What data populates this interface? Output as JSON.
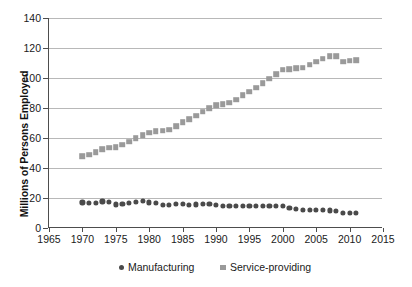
{
  "chart_data": {
    "type": "scatter",
    "title": "",
    "xlabel": "",
    "ylabel": "Millions of Persons Employed",
    "xlim": [
      1965,
      2015
    ],
    "ylim": [
      0,
      140
    ],
    "xticks": [
      1965,
      1970,
      1975,
      1980,
      1985,
      1990,
      1995,
      2000,
      2005,
      2010,
      2015
    ],
    "yticks": [
      0,
      20,
      40,
      60,
      80,
      100,
      120,
      140
    ],
    "grid": "horizontal",
    "legend_position": "bottom-center",
    "x": [
      1970,
      1971,
      1972,
      1973,
      1974,
      1975,
      1976,
      1977,
      1978,
      1979,
      1980,
      1981,
      1982,
      1983,
      1984,
      1985,
      1986,
      1987,
      1988,
      1989,
      1990,
      1991,
      1992,
      1993,
      1994,
      1995,
      1996,
      1997,
      1998,
      1999,
      2000,
      2001,
      2002,
      2003,
      2004,
      2005,
      2006,
      2007,
      2008,
      2009,
      2010,
      2011
    ],
    "series": [
      {
        "name": "Manufacturing",
        "marker": "circle",
        "color": "#4a4a4a",
        "values": [
          17.1,
          16.8,
          17.0,
          17.7,
          17.6,
          15.7,
          16.2,
          16.8,
          17.5,
          17.9,
          17.1,
          17.0,
          15.5,
          15.3,
          16.0,
          15.8,
          15.6,
          15.7,
          15.9,
          15.8,
          15.4,
          14.8,
          14.5,
          14.5,
          14.8,
          15.0,
          14.9,
          15.0,
          15.0,
          14.7,
          14.5,
          13.5,
          12.6,
          12.1,
          12.0,
          11.9,
          11.9,
          11.7,
          11.3,
          10.3,
          10.0,
          10.0
        ]
      },
      {
        "name": "Service-providing",
        "marker": "square",
        "color": "#9a9a9a",
        "values": [
          48.0,
          49.0,
          50.5,
          52.5,
          53.5,
          54.0,
          55.5,
          57.5,
          60.0,
          62.0,
          63.5,
          64.5,
          65.0,
          65.5,
          68.0,
          70.5,
          72.5,
          75.0,
          77.5,
          80.0,
          82.0,
          82.5,
          83.5,
          85.5,
          88.5,
          91.0,
          93.5,
          96.5,
          99.5,
          102.5,
          105.5,
          106.0,
          106.5,
          107.0,
          109.0,
          111.0,
          113.0,
          114.5,
          114.5,
          111.0,
          111.5,
          112.0
        ]
      }
    ]
  },
  "legend": {
    "entries": [
      {
        "label": "Manufacturing"
      },
      {
        "label": "Service-providing"
      }
    ]
  },
  "axes": {
    "y_title": "Millions of Persons Employed",
    "y_labels": [
      "140",
      "120",
      "100",
      "80",
      "60",
      "40",
      "20",
      "0"
    ],
    "x_labels": [
      "1965",
      "1970",
      "1975",
      "1980",
      "1985",
      "1990",
      "1995",
      "2000",
      "2005",
      "2010",
      "2015"
    ]
  }
}
